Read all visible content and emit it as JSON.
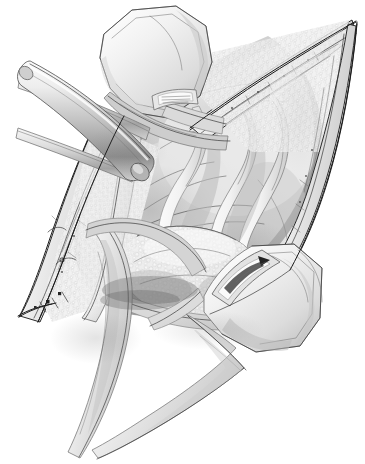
{
  "image": {
    "kind": "medical-surgical-illustration",
    "title": "Surgical exposure through a diamond-shaped incision held open by retractors",
    "style": "grayscale pen-and-ink with airbrush shading",
    "background_color": "#ffffff",
    "width": 365,
    "height": 464,
    "has_text": false,
    "has_caption": false,
    "has_labels": false,
    "has_leader_lines": false
  },
  "palette": {
    "background": "#ffffff",
    "outline": "#1c1c1c",
    "midtone": "#9a9a9a",
    "shadow": "#4f4f4f",
    "deep_shadow": "#2e2e2e",
    "highlight": "#f4f4f4",
    "tissue_light": "#e8e8e8",
    "tissue_mid": "#c6c6c6",
    "metal_light": "#f0f0f0",
    "metal_mid": "#bdbdbd",
    "metal_dark": "#7c7c7c"
  },
  "scene": {
    "orientation": "diamond incision running upper-right to lower-left",
    "elements": [
      {
        "id": "incision-wound",
        "name": "diamond-shaped surgical incision",
        "description": "Elongated diamond / lozenge wound opening, apex at upper right, lower vertex at lower left, outlined with a fine dark contour"
      },
      {
        "id": "wound-edge-upper-right",
        "name": "upper-right incision margin",
        "description": "Everted skin and subcutaneous fat edge with stippled lobular texture"
      },
      {
        "id": "wound-edge-lower-left",
        "name": "lower-left incision margin",
        "description": "Opposing skin and fat edge with stippled lobular texture"
      },
      {
        "id": "retractor-blade-top",
        "name": "upper retractor blade",
        "description": "Angular hexagonal metal paddle entering from the top, with an oblong slot near its tip"
      },
      {
        "id": "retractor-blade-bottom",
        "name": "lower-right retractor blade",
        "description": "Angular hexagonal metal paddle entering from lower right, with an oblong slot and dark interior marking"
      },
      {
        "id": "retractor-rod-thick",
        "name": "thick cylindrical retractor rod",
        "description": "Diagonal round metal bar crossing the upper-left field, tip resting in the wound"
      },
      {
        "id": "retractor-rod-thin",
        "name": "thin cylindrical retractor rod",
        "description": "Slimmer horizontal round metal bar crossing behind the thick rod at upper left"
      },
      {
        "id": "retractor-arm-left",
        "name": "lower-left retractor arm",
        "description": "Broad tapering blade sweeping from the wound down and out of frame at bottom left"
      },
      {
        "id": "retractor-arm-lower",
        "name": "lower tapering retractor arm",
        "description": "Second narrow tapering blade crossing the first near the bottom of the frame"
      },
      {
        "id": "nerve-bands",
        "name": "pale S-curved nerve and vessel bands",
        "description": "Three slender light ribbons curving through the centre-right of the exposure"
      },
      {
        "id": "lobulated-mass",
        "name": "lobulated glandular mass",
        "description": "Mottled rounded structure low in the wound, with cobbled surface texture"
      },
      {
        "id": "deep-tissue-plane",
        "name": "deep tissue plane",
        "description": "Smooth shaded fascia floor of the exposure behind the nerve bands"
      },
      {
        "id": "sutures-lower-vertex",
        "name": "sutures at lower incision vertex",
        "description": "Small dark stitch and clip marks near the lower-left point of the wound"
      }
    ]
  }
}
